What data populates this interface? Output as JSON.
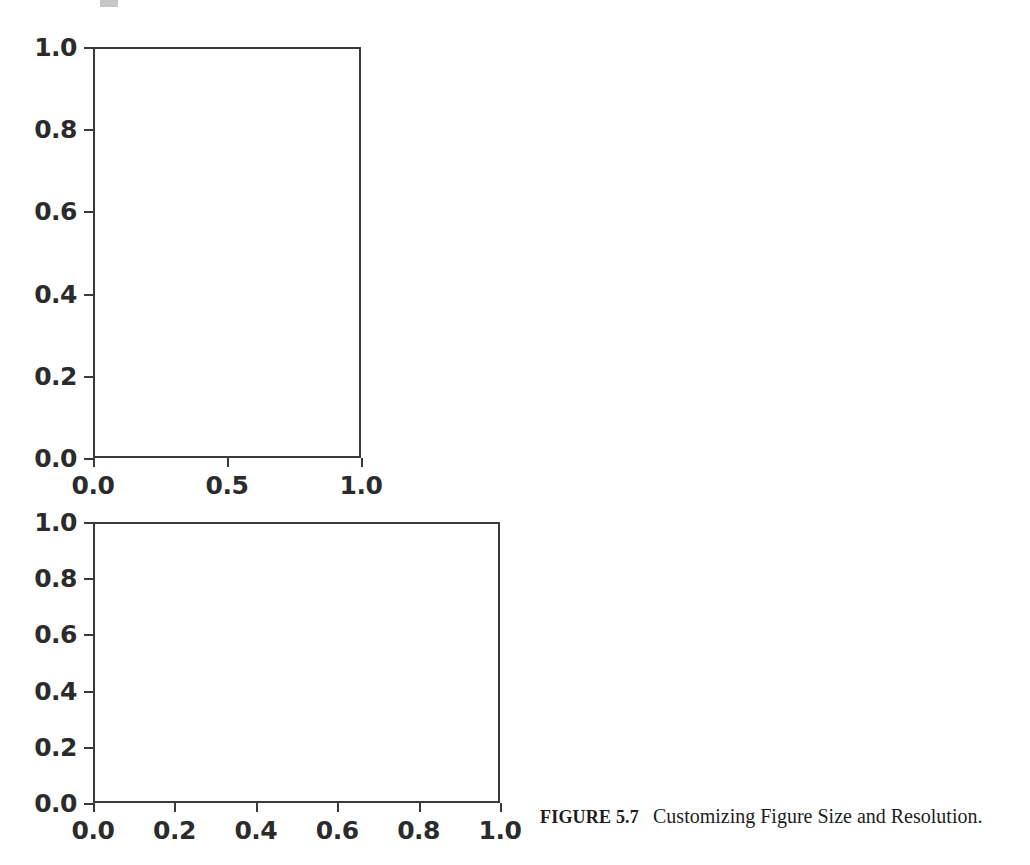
{
  "figure": {
    "caption_label": "FIGURE 5.7",
    "caption_text": "Customizing Figure Size and Resolution.",
    "background_color": "#ffffff",
    "line_color": "#3a3a3a",
    "text_color": "#2b2b2b"
  },
  "chart_data": [
    {
      "id": "upper-axes",
      "type": "line",
      "title": "",
      "xlabel": "",
      "ylabel": "",
      "xlim": [
        0.0,
        1.0
      ],
      "ylim": [
        0.0,
        1.0
      ],
      "xticks": [
        "0.0",
        "0.5",
        "1.0"
      ],
      "xtick_values": [
        0.0,
        0.5,
        1.0
      ],
      "yticks": [
        "0.0",
        "0.2",
        "0.4",
        "0.6",
        "0.8",
        "1.0"
      ],
      "ytick_values": [
        0.0,
        0.2,
        0.4,
        0.6,
        0.8,
        1.0
      ],
      "series": [],
      "grid": false,
      "legend": false,
      "note": "empty axes - no data plotted"
    },
    {
      "id": "lower-axes",
      "type": "line",
      "title": "",
      "xlabel": "",
      "ylabel": "",
      "xlim": [
        0.0,
        1.0
      ],
      "ylim": [
        0.0,
        1.0
      ],
      "xticks": [
        "0.0",
        "0.2",
        "0.4",
        "0.6",
        "0.8",
        "1.0"
      ],
      "xtick_values": [
        0.0,
        0.2,
        0.4,
        0.6,
        0.8,
        1.0
      ],
      "yticks": [
        "0.0",
        "0.2",
        "0.4",
        "0.6",
        "0.8",
        "1.0"
      ],
      "ytick_values": [
        0.0,
        0.2,
        0.4,
        0.6,
        0.8,
        1.0
      ],
      "series": [],
      "grid": false,
      "legend": false,
      "note": "empty axes - no data plotted"
    }
  ]
}
